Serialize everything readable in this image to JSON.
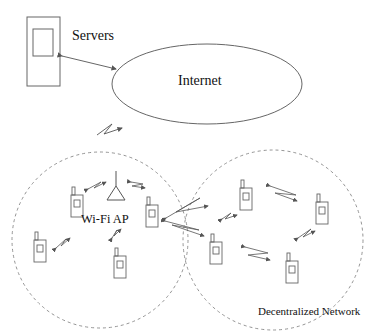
{
  "diagram": {
    "labels": {
      "servers": "Servers",
      "internet": "Internet",
      "wifi_ap": "Wi-Fi AP",
      "decentralized": "Decentralized Network"
    },
    "nodes": {
      "server": {
        "type": "server-box",
        "x": 27,
        "y": 17,
        "w": 33,
        "h": 69
      },
      "internet": {
        "type": "ellipse",
        "cx": 207,
        "cy": 84,
        "rx": 95,
        "ry": 40
      },
      "wifi_ap": {
        "type": "antenna",
        "x": 116,
        "y": 190
      },
      "wifi_cell": {
        "type": "dashed-circle",
        "cx": 100,
        "cy": 240,
        "r": 88
      },
      "decentralized_cell": {
        "type": "dashed-circle",
        "cx": 273,
        "cy": 240,
        "r": 90
      },
      "phones": [
        {
          "x": 71,
          "y": 187
        },
        {
          "x": 146,
          "y": 197
        },
        {
          "x": 34,
          "y": 232
        },
        {
          "x": 114,
          "y": 248
        },
        {
          "x": 240,
          "y": 180
        },
        {
          "x": 316,
          "y": 194
        },
        {
          "x": 210,
          "y": 234
        },
        {
          "x": 286,
          "y": 253
        }
      ]
    },
    "colors": {
      "stroke": "#555555",
      "dashed": "#888888",
      "text": "#111111"
    }
  }
}
